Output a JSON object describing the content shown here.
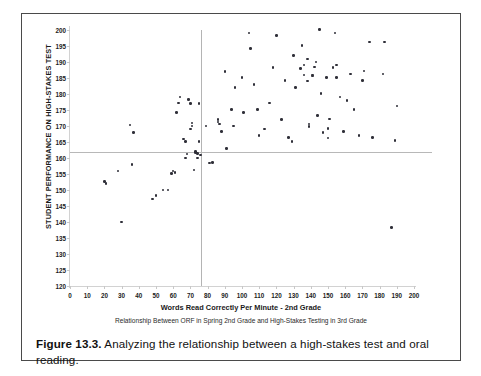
{
  "figure": {
    "caption_label": "Figure 13.3.",
    "caption_text": " Analyzing the relationship between a high-stakes test and oral reading."
  },
  "chart_data": {
    "type": "scatter",
    "title": "",
    "subtitle": "Relationship Between ORF in Spring 2nd Grade and High-Stakes Testing in 3rd Grade",
    "xlabel": "Words Read Correctly Per Minute - 2nd Grade",
    "ylabel": "STUDENT PERFORMANCE ON HIGH-STAKES TEST",
    "xlim": [
      0,
      200
    ],
    "ylim": [
      120,
      200
    ],
    "xticks": [
      0,
      10,
      20,
      30,
      40,
      50,
      60,
      70,
      80,
      90,
      100,
      110,
      120,
      130,
      140,
      150,
      160,
      170,
      180,
      190,
      200
    ],
    "yticks": [
      120,
      125,
      130,
      135,
      140,
      145,
      150,
      155,
      160,
      165,
      170,
      175,
      180,
      185,
      190,
      195,
      200
    ],
    "grid": false,
    "legend": "none",
    "marker_color": "#2f2f38",
    "reference_lines": [
      {
        "name": "vertical-cutpoint",
        "axis": "x",
        "value": 76,
        "color": "#b4b4b4"
      },
      {
        "name": "horizontal-cutpoint",
        "axis": "y",
        "value": 162,
        "color": "#b8b8b8"
      }
    ],
    "points": [
      [
        20,
        152.6
      ],
      [
        21,
        152.0
      ],
      [
        28,
        156.0
      ],
      [
        30,
        140.0
      ],
      [
        35,
        170.3
      ],
      [
        36,
        158.0
      ],
      [
        37,
        168.0
      ],
      [
        48,
        147.2
      ],
      [
        50,
        148.2
      ],
      [
        54,
        150.0
      ],
      [
        57,
        150.0
      ],
      [
        59,
        155.2
      ],
      [
        60,
        156.0
      ],
      [
        61,
        155.4
      ],
      [
        62,
        174.2
      ],
      [
        63,
        177.2
      ],
      [
        64,
        179.0
      ],
      [
        66,
        166.0
      ],
      [
        67,
        165.2
      ],
      [
        67,
        160.0
      ],
      [
        68,
        161.2
      ],
      [
        69,
        178.2
      ],
      [
        70,
        177.0
      ],
      [
        71,
        171.0
      ],
      [
        71,
        170.0
      ],
      [
        70,
        169.0
      ],
      [
        72,
        156.2
      ],
      [
        73,
        162.0
      ],
      [
        73,
        161.8
      ],
      [
        74,
        161.4
      ],
      [
        74,
        160.0
      ],
      [
        75,
        165.2
      ],
      [
        75,
        177.0
      ],
      [
        76,
        161.0
      ],
      [
        79,
        170.0
      ],
      [
        81,
        158.4
      ],
      [
        83,
        158.6
      ],
      [
        86,
        171.2
      ],
      [
        87,
        170.6
      ],
      [
        86,
        172.0
      ],
      [
        88,
        168.2
      ],
      [
        90,
        187.0
      ],
      [
        91,
        163.0
      ],
      [
        94,
        175.2
      ],
      [
        95,
        170.0
      ],
      [
        96,
        182.0
      ],
      [
        100,
        185.2
      ],
      [
        101,
        174.2
      ],
      [
        104,
        199.0
      ],
      [
        105,
        194.2
      ],
      [
        107,
        183.0
      ],
      [
        109,
        175.2
      ],
      [
        110,
        167.0
      ],
      [
        113,
        169.0
      ],
      [
        116,
        177.2
      ],
      [
        118,
        188.2
      ],
      [
        120,
        198.2
      ],
      [
        123,
        172.0
      ],
      [
        125,
        184.2
      ],
      [
        127,
        166.4
      ],
      [
        129,
        165.2
      ],
      [
        130,
        192.0
      ],
      [
        131,
        182.0
      ],
      [
        134,
        188.0
      ],
      [
        135,
        195.2
      ],
      [
        136,
        186.0
      ],
      [
        136,
        189.0
      ],
      [
        138,
        191.0
      ],
      [
        138,
        184.0
      ],
      [
        139,
        170.6
      ],
      [
        139,
        169.8
      ],
      [
        141,
        186.0
      ],
      [
        141,
        185.6
      ],
      [
        142,
        188.4
      ],
      [
        143,
        190.0
      ],
      [
        144,
        173.2
      ],
      [
        145,
        200.2
      ],
      [
        146,
        180.2
      ],
      [
        147,
        168.0
      ],
      [
        149,
        185.2
      ],
      [
        150,
        169.2
      ],
      [
        150,
        166.2
      ],
      [
        151,
        172.2
      ],
      [
        153,
        188.2
      ],
      [
        154,
        199.0
      ],
      [
        155,
        185.2
      ],
      [
        155,
        189.0
      ],
      [
        157,
        179.0
      ],
      [
        159,
        168.2
      ],
      [
        161,
        178.0
      ],
      [
        163,
        186.2
      ],
      [
        165,
        175.2
      ],
      [
        168,
        167.0
      ],
      [
        170,
        184.2
      ],
      [
        171,
        187.2
      ],
      [
        174,
        196.2
      ],
      [
        176,
        166.4
      ],
      [
        182,
        186.2
      ],
      [
        183,
        196.2
      ],
      [
        187,
        138.2
      ],
      [
        189,
        165.4
      ],
      [
        190,
        176.2
      ]
    ]
  }
}
